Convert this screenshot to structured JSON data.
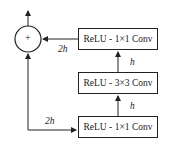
{
  "diagram": {
    "type": "bottleneck residual block",
    "blocks": [
      {
        "id": "top",
        "label": "ReLU - 1×1 Conv"
      },
      {
        "id": "middle",
        "label": "ReLU - 3×3 Conv"
      },
      {
        "id": "bottom",
        "label": "ReLU - 1×1 Conv"
      }
    ],
    "sum_node": {
      "symbol": "+"
    },
    "edge_labels": {
      "input_to_bottom": "2h",
      "bottom_to_middle": "h",
      "middle_to_top": "h",
      "top_to_sum": "2h"
    }
  }
}
